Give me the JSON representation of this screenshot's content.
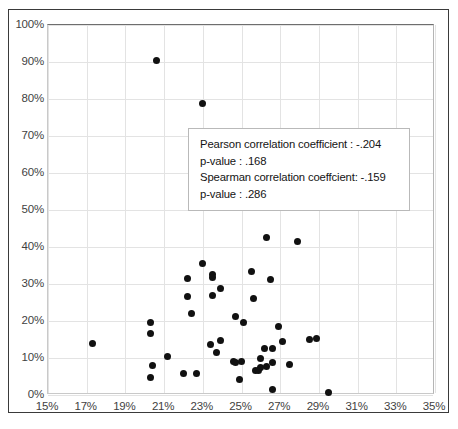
{
  "chart_data": {
    "type": "scatter",
    "title": "",
    "xlabel": "",
    "ylabel": "",
    "xlim": [
      15,
      35
    ],
    "ylim": [
      0,
      100
    ],
    "xtick_labels": [
      "15%",
      "17%",
      "19%",
      "21%",
      "23%",
      "25%",
      "27%",
      "29%",
      "31%",
      "33%",
      "35%"
    ],
    "ytick_labels": [
      "0%",
      "10%",
      "20%",
      "30%",
      "40%",
      "50%",
      "60%",
      "70%",
      "80%",
      "90%",
      "100%"
    ],
    "xticks": [
      15,
      17,
      19,
      21,
      23,
      25,
      27,
      29,
      31,
      33,
      35
    ],
    "yticks": [
      0,
      10,
      20,
      30,
      40,
      50,
      60,
      70,
      80,
      90,
      100
    ],
    "grid": true,
    "legend": "none",
    "marker": "filled-circle",
    "marker_color": "#111111",
    "points": [
      {
        "x": 20.6,
        "y": 90.5
      },
      {
        "x": 23.0,
        "y": 78.8
      },
      {
        "x": 26.3,
        "y": 42.6
      },
      {
        "x": 27.9,
        "y": 41.5
      },
      {
        "x": 23.0,
        "y": 35.5
      },
      {
        "x": 25.5,
        "y": 33.4
      },
      {
        "x": 23.5,
        "y": 32.6
      },
      {
        "x": 23.5,
        "y": 31.8
      },
      {
        "x": 26.5,
        "y": 31.2
      },
      {
        "x": 22.2,
        "y": 31.4
      },
      {
        "x": 23.9,
        "y": 28.9
      },
      {
        "x": 22.2,
        "y": 26.6
      },
      {
        "x": 23.5,
        "y": 27.0
      },
      {
        "x": 25.6,
        "y": 26.2
      },
      {
        "x": 22.4,
        "y": 22.0
      },
      {
        "x": 24.7,
        "y": 21.2
      },
      {
        "x": 25.1,
        "y": 19.7
      },
      {
        "x": 20.3,
        "y": 19.7
      },
      {
        "x": 26.9,
        "y": 18.6
      },
      {
        "x": 20.3,
        "y": 16.6
      },
      {
        "x": 28.5,
        "y": 15.1
      },
      {
        "x": 28.9,
        "y": 15.3
      },
      {
        "x": 23.9,
        "y": 14.8
      },
      {
        "x": 27.1,
        "y": 14.5
      },
      {
        "x": 17.3,
        "y": 14.0
      },
      {
        "x": 23.4,
        "y": 13.6
      },
      {
        "x": 26.2,
        "y": 12.5
      },
      {
        "x": 26.6,
        "y": 12.5
      },
      {
        "x": 23.7,
        "y": 11.4
      },
      {
        "x": 21.2,
        "y": 10.4
      },
      {
        "x": 26.0,
        "y": 10.0
      },
      {
        "x": 24.6,
        "y": 9.1
      },
      {
        "x": 24.7,
        "y": 8.9
      },
      {
        "x": 25.0,
        "y": 9.0
      },
      {
        "x": 26.6,
        "y": 8.8
      },
      {
        "x": 27.5,
        "y": 8.2
      },
      {
        "x": 20.4,
        "y": 7.9
      },
      {
        "x": 26.0,
        "y": 7.4
      },
      {
        "x": 26.3,
        "y": 7.7
      },
      {
        "x": 25.7,
        "y": 6.5
      },
      {
        "x": 25.9,
        "y": 6.6
      },
      {
        "x": 22.0,
        "y": 5.9
      },
      {
        "x": 22.7,
        "y": 5.8
      },
      {
        "x": 20.3,
        "y": 4.8
      },
      {
        "x": 24.9,
        "y": 4.2
      },
      {
        "x": 26.6,
        "y": 1.5
      },
      {
        "x": 29.5,
        "y": 0.8
      }
    ]
  },
  "annotation": {
    "lines": [
      "Pearson correlation coefficient : -.204",
      "p-value : .168",
      "Spearman correlation coeffcient: -.159",
      "p-value : .286"
    ],
    "pearson_r": "-.204",
    "pearson_p": ".168",
    "spearman_rho": "-.159",
    "spearman_p": ".286"
  }
}
